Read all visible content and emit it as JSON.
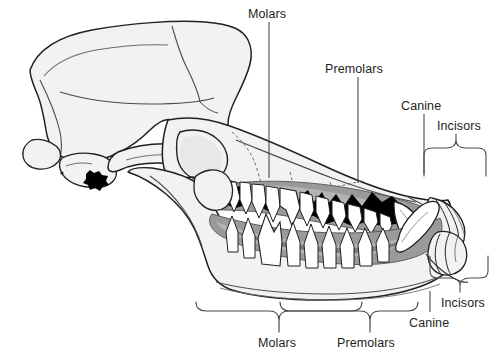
{
  "figure": {
    "background_color": "#ffffff",
    "width": 490,
    "height": 356
  },
  "palette": {
    "outline": "#231f20",
    "bone_light": "#f1f1f1",
    "bone_mid": "#d9d9d9",
    "gum_gray": "#9a9a9a",
    "gum_dark": "#7d7d7d",
    "tooth_white": "#ffffff",
    "shadow_black": "#000000",
    "label_color": "#231f20",
    "leader_line": "#4a4a4a"
  },
  "labels": {
    "top": [
      {
        "id": "molars-top",
        "text": "Molars",
        "x": 248,
        "y": 8,
        "leader_x": 269,
        "leader_y1": 22,
        "leader_y2": 178,
        "type": "line"
      },
      {
        "id": "premolars-top",
        "text": "Premolars",
        "x": 325,
        "y": 63,
        "leader_x": 358,
        "leader_y1": 77,
        "leader_y2": 182,
        "type": "line"
      },
      {
        "id": "canine-top",
        "text": "Canine",
        "x": 401,
        "y": 100,
        "leader_x": 424,
        "leader_y1": 114,
        "leader_y2": 172,
        "type": "line"
      },
      {
        "id": "incisors-top",
        "text": "Incisors",
        "x": 437,
        "y": 120,
        "leader_x": 456,
        "leader_y1": 134,
        "leader_y2": 150,
        "type": "brace"
      }
    ],
    "bottom": [
      {
        "id": "molars-bottom",
        "text": "Molars",
        "x": 258,
        "y": 337,
        "leader_x": 279,
        "leader_y1": 310,
        "leader_y2": 332,
        "type": "brace"
      },
      {
        "id": "premolars-bottom",
        "text": "Premolars",
        "x": 337,
        "y": 337,
        "leader_x": 370,
        "leader_y1": 310,
        "leader_y2": 332,
        "type": "brace"
      },
      {
        "id": "canine-bottom",
        "text": "Canine",
        "x": 409,
        "y": 317,
        "leader_x": 430,
        "leader_y1": 291,
        "leader_y2": 312,
        "type": "line"
      },
      {
        "id": "incisors-bottom",
        "text": "Incisors",
        "x": 441,
        "y": 297,
        "leader_x": 460,
        "leader_y1": 272,
        "leader_y2": 292,
        "type": "brace"
      }
    ]
  },
  "anatomy": {
    "regions": [
      "cranium",
      "sagittal-crest",
      "zygomatic-arch",
      "orbit",
      "nasal-bone",
      "maxilla",
      "mandible",
      "upper-dental-arcade",
      "lower-dental-arcade"
    ],
    "tooth_groups": [
      "molars",
      "premolars",
      "canine",
      "incisors"
    ]
  }
}
